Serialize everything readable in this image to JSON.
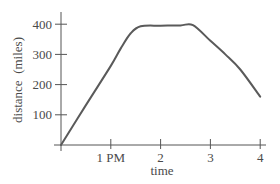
{
  "chart_data": {
    "type": "line",
    "title": "",
    "xlabel": "time",
    "ylabel": "distance  (miles)",
    "x_tick_labels": [
      "1 PM",
      "2",
      "3",
      "4"
    ],
    "x_tick_values": [
      1,
      2,
      3,
      4
    ],
    "y_tick_labels": [
      "100",
      "200",
      "300",
      "400"
    ],
    "y_tick_values": [
      100,
      200,
      300,
      400
    ],
    "xlim": [
      0,
      4
    ],
    "ylim": [
      0,
      430
    ],
    "grid": false,
    "legend": null,
    "series": [
      {
        "name": "distance",
        "x": [
          0,
          0.5,
          1.0,
          1.2,
          1.4,
          1.6,
          2.0,
          2.4,
          2.65,
          3.0,
          3.3,
          3.6,
          4.0
        ],
        "y": [
          0,
          132,
          262,
          320,
          370,
          393,
          395,
          396,
          397,
          345,
          300,
          250,
          160
        ]
      }
    ],
    "x_meaning": "hours after 12 noon (origin = noon)"
  },
  "style": {
    "line_color": "#5a5a5a",
    "axis_color": "#555555"
  }
}
